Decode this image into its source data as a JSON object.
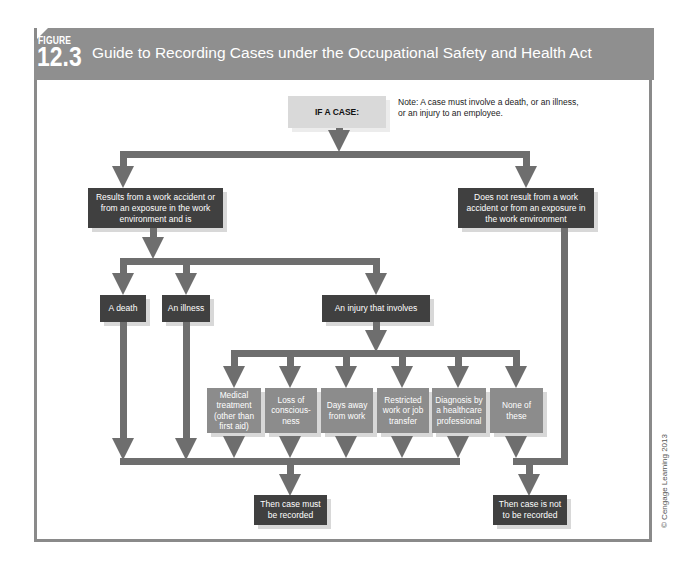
{
  "figure": {
    "label": "FIGURE",
    "number": "12.3",
    "title": "Guide to Recording Cases under the Occupational Safety and Health Act"
  },
  "colors": {
    "header": "#8f8f8f",
    "arrow": "#6e6e6e",
    "dark_box": "#404040",
    "mid_box": "#8c8c8c",
    "light_box": "#d9d9d9"
  },
  "flow": {
    "start": "IF A CASE:",
    "note": "Note: A case must involve a death, or an illness, or an injury to an employee.",
    "branch_left": "Results from a work accident or from an exposure in the work environment and is",
    "branch_right": "Does not result from a work accident or from an exposure in the work environment",
    "level2": [
      "A death",
      "An illness",
      "An injury that involves"
    ],
    "injuries": [
      "Medical treatment (other than first aid)",
      "Loss of conscious-ness",
      "Days away from work",
      "Restricted work or job transfer",
      "Diagnosis by a healthcare professional",
      "None of these"
    ],
    "outcome_recorded": "Then case must be recorded",
    "outcome_not_recorded": "Then case is not to be recorded"
  },
  "copyright": "© Cengage Learning 2013"
}
